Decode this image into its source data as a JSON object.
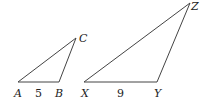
{
  "diagram": {
    "type": "similar-triangles",
    "triangles": [
      {
        "name": "ABC",
        "vertices": {
          "A": {
            "label": "A",
            "x": 18,
            "y": 82
          },
          "B": {
            "label": "B",
            "x": 59,
            "y": 82
          },
          "C": {
            "label": "C",
            "x": 76,
            "y": 38
          }
        },
        "side_labels": [
          {
            "side": "AB",
            "text": "5"
          }
        ]
      },
      {
        "name": "XYZ",
        "vertices": {
          "X": {
            "label": "X",
            "x": 84,
            "y": 82
          },
          "Y": {
            "label": "Y",
            "x": 157,
            "y": 82
          },
          "Z": {
            "label": "Z",
            "x": 190,
            "y": 3
          }
        },
        "side_labels": [
          {
            "side": "XY",
            "text": "9"
          }
        ]
      }
    ],
    "colors": {
      "stroke": "#444444",
      "text": "#222222",
      "background": "#ffffff"
    }
  }
}
